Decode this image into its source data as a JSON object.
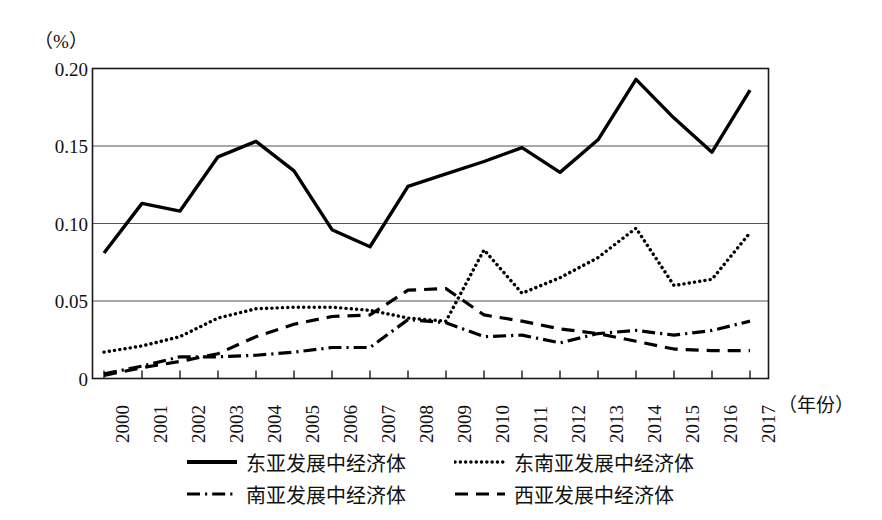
{
  "chart_data": {
    "type": "line",
    "title": "",
    "subtitle": "",
    "unit_label": "（%）",
    "ylabel": "",
    "xlabel": "（年份）",
    "ylim": [
      0,
      0.2
    ],
    "yticks": [
      "0",
      "0.05",
      "0.10",
      "0.15",
      "0.20"
    ],
    "ytick_values": [
      0,
      0.05,
      0.1,
      0.15,
      0.2
    ],
    "grid": true,
    "grid_axis": "y",
    "legend_position": "bottom",
    "categories": [
      "2000",
      "2001",
      "2002",
      "2003",
      "2004",
      "2005",
      "2006",
      "2007",
      "2008",
      "2009",
      "2010",
      "2011",
      "2012",
      "2013",
      "2014",
      "2015",
      "2016",
      "2017"
    ],
    "x": [
      2000,
      2001,
      2002,
      2003,
      2004,
      2005,
      2006,
      2007,
      2008,
      2009,
      2010,
      2011,
      2012,
      2013,
      2014,
      2015,
      2016,
      2017
    ],
    "series": [
      {
        "name": "东亚发展中经济体",
        "style": "solid",
        "color": "#000000",
        "values": [
          0.081,
          0.113,
          0.108,
          0.143,
          0.153,
          0.134,
          0.096,
          0.085,
          0.124,
          0.132,
          0.14,
          0.149,
          0.133,
          0.154,
          0.193,
          0.168,
          0.146,
          0.186
        ]
      },
      {
        "name": "东南亚发展中经济体",
        "style": "dotted",
        "color": "#000000",
        "values": [
          0.017,
          0.021,
          0.027,
          0.039,
          0.045,
          0.046,
          0.046,
          0.044,
          0.039,
          0.037,
          0.083,
          0.055,
          0.065,
          0.078,
          0.097,
          0.06,
          0.064,
          0.094
        ]
      },
      {
        "name": "南亚发展中经济体",
        "style": "dashdot",
        "color": "#000000",
        "values": [
          0.003,
          0.008,
          0.014,
          0.014,
          0.015,
          0.017,
          0.02,
          0.02,
          0.038,
          0.036,
          0.027,
          0.028,
          0.023,
          0.029,
          0.031,
          0.028,
          0.031,
          0.037
        ]
      },
      {
        "name": "西亚发展中经济体",
        "style": "dashed",
        "color": "#000000",
        "values": [
          0.002,
          0.007,
          0.011,
          0.016,
          0.027,
          0.035,
          0.04,
          0.041,
          0.057,
          0.058,
          0.041,
          0.037,
          0.032,
          0.029,
          0.024,
          0.019,
          0.018,
          0.018
        ]
      }
    ]
  },
  "legend": {
    "items": [
      {
        "label": "东亚发展中经济体",
        "style": "solid"
      },
      {
        "label": "东南亚发展中经济体",
        "style": "dotted"
      },
      {
        "label": "南亚发展中经济体",
        "style": "dashdot"
      },
      {
        "label": "西亚发展中经济体",
        "style": "dashed"
      }
    ]
  },
  "colors": {
    "line": "#000000",
    "frame": "#1a1a1a",
    "grid": "#555555",
    "background": "#ffffff"
  }
}
